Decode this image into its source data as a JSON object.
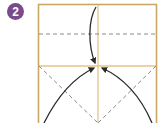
{
  "step": {
    "number": "2",
    "badge_color": "#7a4b8a"
  },
  "colors": {
    "paper_edge": "#c9a764",
    "crease_gold": "#e3c48a",
    "dashed_fold": "#8a8a8a",
    "arrow": "#2a2a2a"
  },
  "icons": {
    "fold_arrow": "curved-arrow"
  }
}
